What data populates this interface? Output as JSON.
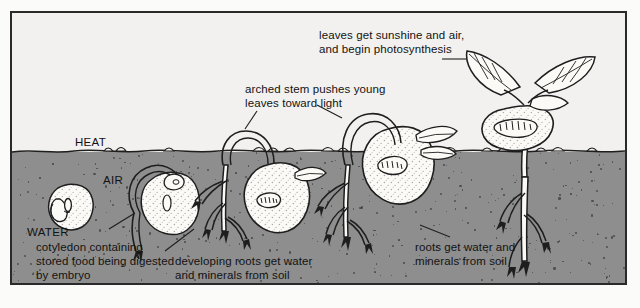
{
  "figure": {
    "environment_labels": [
      {
        "id": "heat",
        "text": "HEAT"
      },
      {
        "id": "air",
        "text": "AIR"
      },
      {
        "id": "water",
        "text": "WATER"
      }
    ],
    "annotations": [
      {
        "id": "leaves-photosynthesis",
        "line1": "leaves get sunshine and air,",
        "line2": "and begin photosynthesis"
      },
      {
        "id": "arched-stem",
        "line1": "arched stem pushes young",
        "line2": "leaves toward light"
      },
      {
        "id": "cotyledon",
        "line1": "cotyledon containing",
        "line2": "stored food being digested",
        "line3": "by embryo"
      },
      {
        "id": "developing-roots",
        "line1": "developing roots get water",
        "line2": "and minerals from soil"
      },
      {
        "id": "roots-water-minerals",
        "line1": "roots get water and",
        "line2": "minerals from soil"
      }
    ],
    "colors": {
      "sky": "#f2f1ef",
      "soil": "#8e8e8e",
      "ink": "#1e1e1e",
      "frame": "#2a2a2a",
      "seed_fill": "#fbfaf7"
    },
    "stages": [
      {
        "id": "stage-1-dormant-seed",
        "label": "imbibed seed below soil"
      },
      {
        "id": "stage-2-radicle",
        "label": "seed with emerging radicle"
      },
      {
        "id": "stage-3-arched-stem",
        "label": "arched stem with roots"
      },
      {
        "id": "stage-4-emerging",
        "label": "seedling pushing above soil"
      },
      {
        "id": "stage-5-photosynthesis",
        "label": "upright seedling with leaves"
      }
    ]
  }
}
